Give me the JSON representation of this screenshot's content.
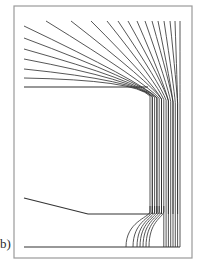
{
  "figure": {
    "panel_label": "b)",
    "colors": {
      "frame": "#9a9a9a",
      "lines": "#2b2b2b",
      "boundary": "#333333",
      "background": "#ffffff"
    },
    "frame": {
      "x": 14,
      "y": 6,
      "width": 178,
      "height": 252
    },
    "boundaries": {
      "upper_horizontal": {
        "x1": 24,
        "y1": 87,
        "x2": 148,
        "y2": 87
      },
      "lower_segment": [
        [
          24,
          198
        ],
        [
          88,
          214
        ],
        [
          150,
          214
        ]
      ],
      "baseline": {
        "x1": 24,
        "y1": 247,
        "x2": 180,
        "y2": 247
      }
    },
    "corner_top": [
      148,
      86
    ],
    "corner_bottom": [
      150,
      214
    ],
    "fan_left_starts_y": [
      26,
      38,
      49,
      59,
      69,
      78
    ],
    "fan_top_starts_x": [
      46,
      71,
      91,
      107,
      118,
      128,
      137,
      145,
      152,
      158,
      164,
      170,
      175,
      180
    ],
    "fan_top_y": 21,
    "bundle_x": [
      150,
      152.3,
      154.6,
      156.9,
      159.2,
      161.5,
      163.8,
      166.1,
      168.4,
      170.7,
      173,
      175.3,
      177.6,
      180
    ],
    "bottom_arc_ends_x": [
      126,
      133,
      137,
      140,
      143,
      146,
      149
    ]
  }
}
